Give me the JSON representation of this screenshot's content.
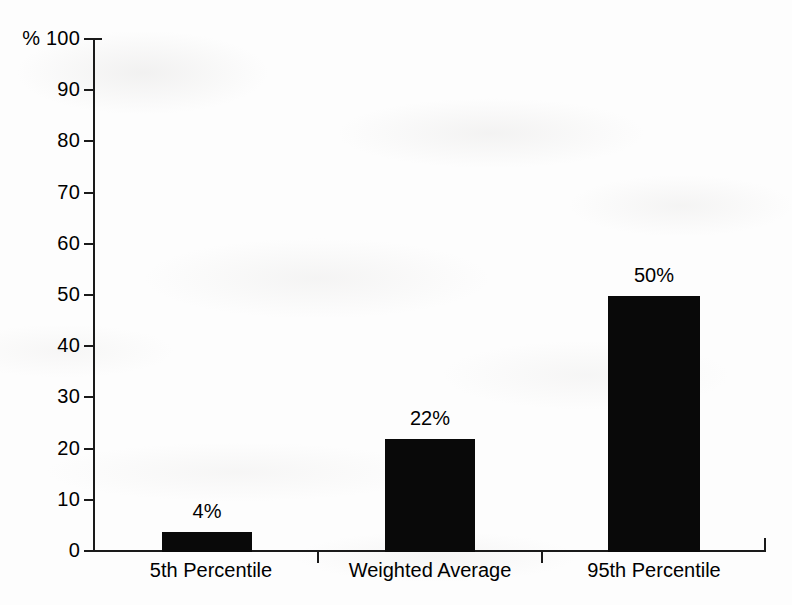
{
  "chart_data": {
    "type": "bar",
    "title": "",
    "xlabel": "",
    "ylabel": "%",
    "categories": [
      "5th Percentile",
      "Weighted Average",
      "95th Percentile"
    ],
    "values": [
      4,
      22,
      50
    ],
    "value_labels": [
      "4%",
      "22%",
      "50%"
    ],
    "ylim": [
      0,
      100
    ],
    "y_ticks": [
      0,
      10,
      20,
      30,
      40,
      50,
      60,
      70,
      80,
      90,
      100
    ],
    "y_tick_labels": [
      "0",
      "10",
      "20",
      "30",
      "40",
      "50",
      "60",
      "70",
      "80",
      "90",
      "100"
    ],
    "y_axis_unit_prefix": "%",
    "top_tick_label": "% 100",
    "grid": false,
    "legend": null,
    "bar_color": "#090909",
    "axis_color": "#1a1a1a",
    "background_color": "#fdfdfd"
  },
  "axis": {
    "y": {
      "ticks": [
        {
          "label": "% 100",
          "value": 100
        },
        {
          "label": "90",
          "value": 90
        },
        {
          "label": "80",
          "value": 80
        },
        {
          "label": "70",
          "value": 70
        },
        {
          "label": "60",
          "value": 60
        },
        {
          "label": "50",
          "value": 50
        },
        {
          "label": "40",
          "value": 40
        },
        {
          "label": "30",
          "value": 30
        },
        {
          "label": "20",
          "value": 20
        },
        {
          "label": "10",
          "value": 10
        },
        {
          "label": "0",
          "value": 0
        }
      ]
    }
  },
  "bars": [
    {
      "category": "5th Percentile",
      "value": 4,
      "value_label": "4%"
    },
    {
      "category": "Weighted Average",
      "value": 22,
      "value_label": "22%"
    },
    {
      "category": "95th Percentile",
      "value": 50,
      "value_label": "50%"
    }
  ]
}
